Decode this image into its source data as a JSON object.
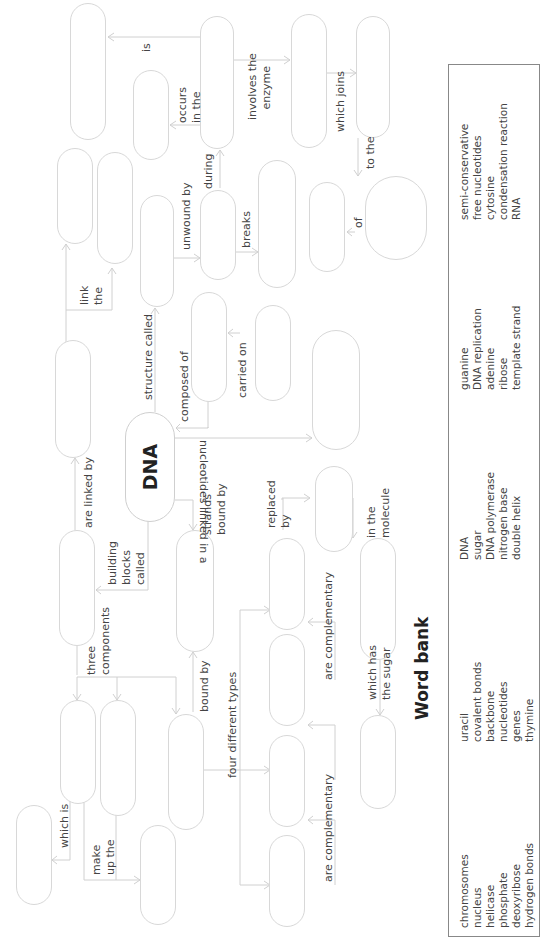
{
  "central_concept": "DNA",
  "links": {
    "is": "is",
    "occurs_in_the": "occurs\nin the",
    "involves_the_enzyme": "involves the\n   enzyme",
    "which_joins": "which joins",
    "to_the": "to the",
    "of": "of",
    "during": "during",
    "unwound_by": "unwound by",
    "breaks": "breaks",
    "link_the": "link\nthe",
    "structure_called": "structure called",
    "composed_of": "composed of",
    "carried_on": "carried on",
    "nucleotides_linked_in_a": "nucleotides linked in a",
    "are_linked_by": "are linked by",
    "building_blocks_called": "building\nblocks\ncalled",
    "strands_bound_by": "strands\nbound by",
    "replaced_by": "replaced\nby",
    "in_the_molecule": "in the\nmolecule",
    "three_components": "three\ncomponents",
    "bound_by": "bound by",
    "four_different_types": "four different types",
    "are_complementary_1": "are complementary",
    "are_complementary_2": "are complementary",
    "which_has_the_sugar": "which has\nthe sugar",
    "which_is": "which is",
    "make_up_the": "make\nup the"
  },
  "word_bank": {
    "title": "Word bank",
    "columns": [
      [
        "chromosomes",
        "nucleus",
        "helicase",
        "phosphate",
        "deoxyribose",
        "hydrogen bonds"
      ],
      [
        "uracil",
        "covalent bonds",
        "backbone",
        "nucleotides",
        "genes",
        "thymine"
      ],
      [
        "DNA",
        "sugar",
        "DNA polymerase",
        "nitrogen base",
        "double helix"
      ],
      [
        "guanine",
        "DNA replication",
        "adenine",
        "ribose",
        "template strand"
      ],
      [
        "semi-conservative",
        "free nucleotides",
        "cytosine",
        "condensation reaction",
        "RNA"
      ]
    ]
  }
}
